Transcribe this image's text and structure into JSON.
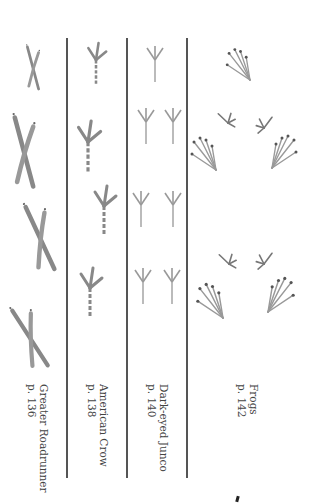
{
  "columns": [
    {
      "name": "Greater Roadrunner",
      "page": "p. 136",
      "track_type": "roadrunner-x-track"
    },
    {
      "name": "American Crow",
      "page": "p. 138",
      "track_type": "crow-track"
    },
    {
      "name": "Dark-eyed Junco",
      "page": "p. 140",
      "track_type": "junco-track"
    },
    {
      "name": "Frogs",
      "page": "p. 142",
      "track_type": "frog-track"
    }
  ],
  "colors": {
    "divider": "#555555",
    "track": "#7a7a7a",
    "text": "#444444"
  }
}
